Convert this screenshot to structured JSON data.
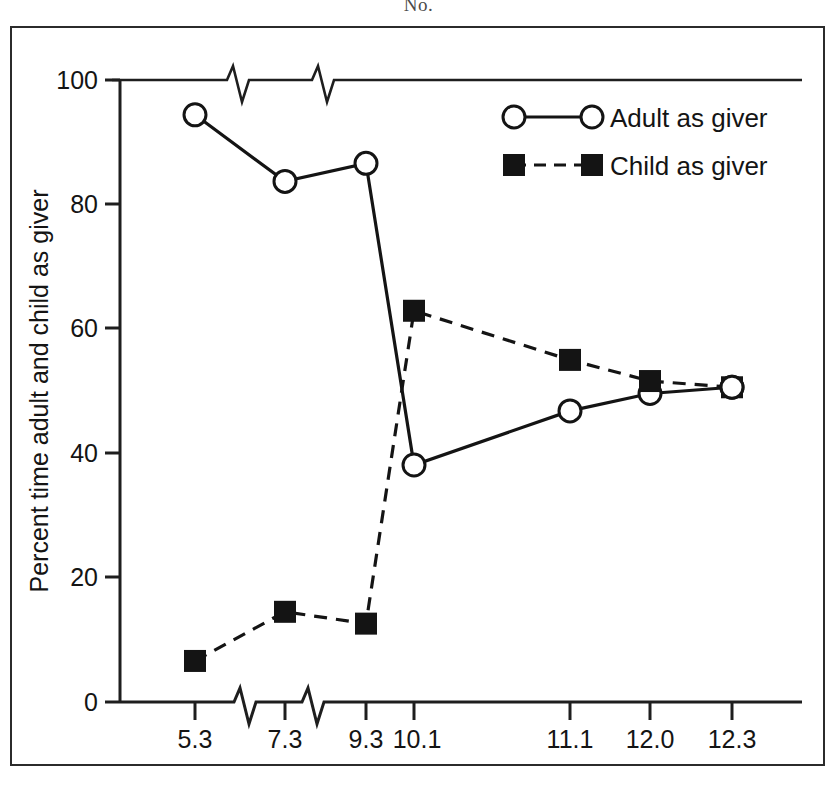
{
  "figure": {
    "caption": "No."
  },
  "chart_data": {
    "type": "line",
    "title": "",
    "xlabel": "Age (months and weeks)",
    "ylabel": "Percent time adult and child as giver",
    "categories": [
      "5.3",
      "7.3",
      "9.3",
      "10.1",
      "11.1",
      "12.0",
      "12.3"
    ],
    "x_tick_labels": [
      "5.3",
      "7.3",
      "9.3",
      "10.1",
      "11.1",
      "12.0",
      "12.3"
    ],
    "y_tick_labels": [
      "0",
      "20",
      "40",
      "60",
      "80",
      "100"
    ],
    "y_ticks": [
      0,
      20,
      40,
      60,
      80,
      100
    ],
    "ylim": [
      0,
      100
    ],
    "grid": false,
    "legend_position": "top-right",
    "axis_breaks": {
      "x_between": [
        "5.3-7.3",
        "7.3-9.3"
      ],
      "note": "zigzag break marks on bottom axis and top frame line"
    },
    "series": [
      {
        "name": "Adult as giver",
        "marker": "open-circle",
        "line_style": "solid",
        "color": "#141414",
        "values": [
          94.4,
          83.7,
          86.6,
          38.1,
          46.8,
          49.6,
          50.6
        ]
      },
      {
        "name": "Child as giver",
        "marker": "filled-square",
        "line_style": "dashed",
        "color": "#141414",
        "values": [
          6.6,
          14.5,
          12.6,
          62.9,
          55.0,
          51.6,
          50.6
        ]
      }
    ]
  },
  "legend": {
    "items": [
      {
        "label": "Adult as  giver",
        "marker": "open-circle",
        "line_style": "solid"
      },
      {
        "label": "Child as  giver",
        "marker": "filled-square",
        "line_style": "dashed"
      }
    ]
  }
}
